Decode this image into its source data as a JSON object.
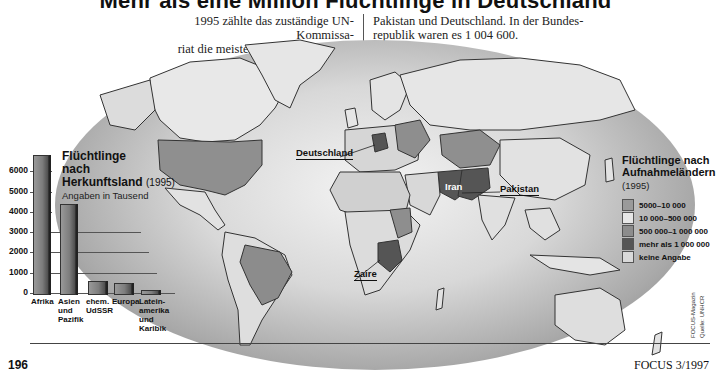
{
  "header": {
    "title": "Mehr als eine Million Flüchtlinge in Deutschland",
    "intro_left": "1995 zählte das zuständige UN-Kommissa-riat die meisten Flüchtlinge in Iran, Zaire,",
    "intro_left_line1": "1995 zählte das zuständige UN-Kommissa-",
    "intro_left_line2": "riat die meisten Flüchtlinge in Iran, Zaire,",
    "intro_right_line1": "Pakistan und Deutschland. In der Bundes-",
    "intro_right_line2": "republik waren es 1 004 600."
  },
  "map": {
    "labels": {
      "deutschland": "Deutschland",
      "iran": "Iran",
      "pakistan": "Pakistan",
      "zaire": "Zaire"
    },
    "legend": {
      "title_line1": "Flüchtlinge nach",
      "title_line2": "Aufnahmeländern",
      "year": "(1995)",
      "items": [
        {
          "label": "5000–10 000",
          "color": "#9a9a9a"
        },
        {
          "label": "10 000–500 000",
          "color": "#e6e6e6"
        },
        {
          "label": "500 000–1 000 000",
          "color": "#8c8c8c"
        },
        {
          "label": "mehr als 1 000 000",
          "color": "#555555"
        },
        {
          "label": "keine Angabe",
          "color": "#d9d9d9"
        }
      ]
    }
  },
  "chart_data": {
    "type": "bar",
    "title": "Flüchtlinge nach Herkunftsland",
    "title_line1": "Flüchtlinge",
    "title_line2": "nach",
    "title_line3": "Herkunftsland",
    "year": "(1995)",
    "subtitle": "Angaben in Tausend",
    "categories": [
      "Afrika",
      "Asien und Pazifik",
      "ehem. UdSSR",
      "Europa",
      "Lateinamerika und Karibik"
    ],
    "category_lines": [
      [
        "Afrika"
      ],
      [
        "Asien",
        "und",
        "Pazifik"
      ],
      [
        "ehem.",
        "UdSSR"
      ],
      [
        "Europa"
      ],
      [
        "Latein-",
        "amerika",
        "und",
        "Karibik"
      ]
    ],
    "values": [
      6800,
      4400,
      600,
      500,
      150
    ],
    "xlabel": "",
    "ylabel": "Angaben in Tausend",
    "yticks": [
      "0",
      "1000",
      "2000",
      "3000",
      "4000",
      "5000",
      "6000"
    ],
    "ylim": [
      0,
      7000
    ],
    "grid": true,
    "legend_position": "none"
  },
  "footer": {
    "page_number": "196",
    "magazine": "FOCUS 3/1997",
    "credit_line1": "FOCUS-Magazin",
    "credit_line2": "Quelle: UNHCR"
  }
}
